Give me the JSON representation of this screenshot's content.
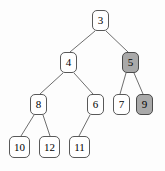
{
  "figure": {
    "background_color": "#fdfdfd",
    "node_fill_default": "#ffffff",
    "node_fill_highlight": "#a9a9a9",
    "node_border_color": "#595959",
    "edge_color": "#6e6e6e",
    "text_color": "#000000"
  },
  "nodes": [
    {
      "id": "n3",
      "label": "3",
      "x": 92,
      "y": 10,
      "w": 17,
      "h": 21,
      "highlighted": false,
      "depth": 0
    },
    {
      "id": "n4",
      "label": "4",
      "x": 60,
      "y": 52,
      "w": 17,
      "h": 21,
      "highlighted": false,
      "depth": 1
    },
    {
      "id": "n5",
      "label": "5",
      "x": 122,
      "y": 52,
      "w": 17,
      "h": 21,
      "highlighted": true,
      "depth": 1
    },
    {
      "id": "n8",
      "label": "8",
      "x": 30,
      "y": 94,
      "w": 17,
      "h": 21,
      "highlighted": false,
      "depth": 2
    },
    {
      "id": "n6",
      "label": "6",
      "x": 87,
      "y": 94,
      "w": 17,
      "h": 21,
      "highlighted": false,
      "depth": 2
    },
    {
      "id": "n7",
      "label": "7",
      "x": 113,
      "y": 94,
      "w": 17,
      "h": 21,
      "highlighted": false,
      "depth": 2
    },
    {
      "id": "n9",
      "label": "9",
      "x": 136,
      "y": 94,
      "w": 17,
      "h": 21,
      "highlighted": true,
      "depth": 2
    },
    {
      "id": "n10",
      "label": "10",
      "x": 9,
      "y": 136,
      "w": 21,
      "h": 22,
      "highlighted": false,
      "depth": 3
    },
    {
      "id": "n12",
      "label": "12",
      "x": 39,
      "y": 136,
      "w": 21,
      "h": 22,
      "highlighted": false,
      "depth": 3
    },
    {
      "id": "n11",
      "label": "11",
      "x": 69,
      "y": 136,
      "w": 21,
      "h": 22,
      "highlighted": false,
      "depth": 3
    }
  ],
  "edges": [
    {
      "id": "e-3-4",
      "from": "n3",
      "to": "n4",
      "x1": 95,
      "y1": 31,
      "x2": 70,
      "y2": 52
    },
    {
      "id": "e-3-5",
      "from": "n3",
      "to": "n5",
      "x1": 106,
      "y1": 31,
      "x2": 128,
      "y2": 52
    },
    {
      "id": "e-4-8",
      "from": "n4",
      "to": "n8",
      "x1": 63,
      "y1": 73,
      "x2": 40,
      "y2": 94
    },
    {
      "id": "e-4-6",
      "from": "n4",
      "to": "n6",
      "x1": 74,
      "y1": 73,
      "x2": 93,
      "y2": 94
    },
    {
      "id": "e-5-7",
      "from": "n5",
      "to": "n7",
      "x1": 126,
      "y1": 73,
      "x2": 120,
      "y2": 94
    },
    {
      "id": "e-5-9",
      "from": "n5",
      "to": "n9",
      "x1": 134,
      "y1": 73,
      "x2": 143,
      "y2": 94
    },
    {
      "id": "e-8-10",
      "from": "n8",
      "to": "n10",
      "x1": 34,
      "y1": 115,
      "x2": 21,
      "y2": 136
    },
    {
      "id": "e-8-12",
      "from": "n8",
      "to": "n12",
      "x1": 43,
      "y1": 115,
      "x2": 50,
      "y2": 136
    },
    {
      "id": "e-6-11",
      "from": "n6",
      "to": "n11",
      "x1": 90,
      "y1": 115,
      "x2": 79,
      "y2": 136
    }
  ]
}
